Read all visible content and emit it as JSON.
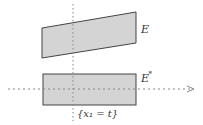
{
  "diagram": {
    "colors": {
      "fill": "#d4d4d4",
      "stroke": "#444444",
      "axis": "#888888",
      "text": "#333333"
    },
    "shapes": [
      {
        "id": "E",
        "label": "E",
        "type": "parallelogram"
      },
      {
        "id": "E_star",
        "label": "E*",
        "type": "rectangle"
      }
    ],
    "labels": {
      "E": "E",
      "E_star_base": "E",
      "E_star_sup": "*",
      "slice": "{x₁ = t}"
    },
    "axes": {
      "horizontal": "dotted arrow",
      "vertical": "dotted line"
    }
  }
}
